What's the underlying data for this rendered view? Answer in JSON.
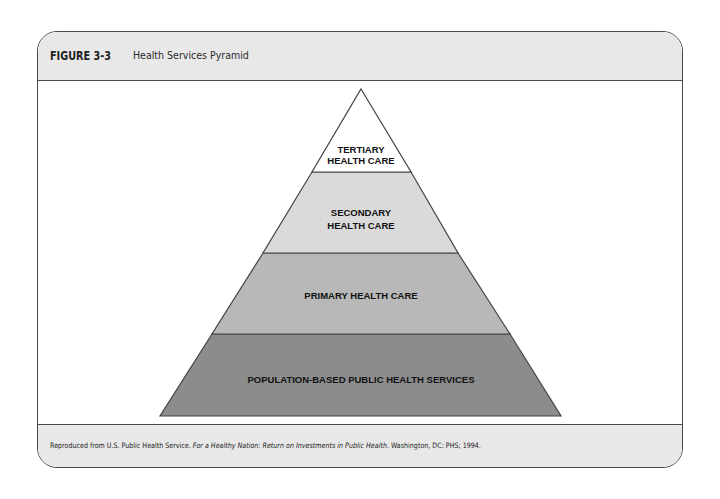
{
  "figure": {
    "number": "FIGURE 3-3",
    "title": "Health Services Pyramid"
  },
  "pyramid": {
    "layers": [
      {
        "id": "tertiary",
        "lines": [
          "TERTIARY",
          "HEALTH CARE"
        ],
        "color": "#ffffff"
      },
      {
        "id": "secondary",
        "lines": [
          "SECONDARY",
          "HEALTH CARE"
        ],
        "color": "#dadada"
      },
      {
        "id": "primary",
        "lines": [
          "PRIMARY HEALTH CARE"
        ],
        "color": "#b8b8b8"
      },
      {
        "id": "population",
        "lines": [
          "POPULATION-BASED PUBLIC HEALTH SERVICES"
        ],
        "color": "#8c8c8c"
      }
    ],
    "stroke_color": "#444444"
  },
  "footer": {
    "credit_prefix": "Reproduced from U.S. Public Health Service. ",
    "credit_title": "For a Healthy Nation: Return on Investments in Public Health",
    "credit_suffix": ". Washington, DC: PHS; 1994."
  },
  "colors": {
    "header_bg": "#e8e8e8",
    "border": "#4a4a4a"
  }
}
